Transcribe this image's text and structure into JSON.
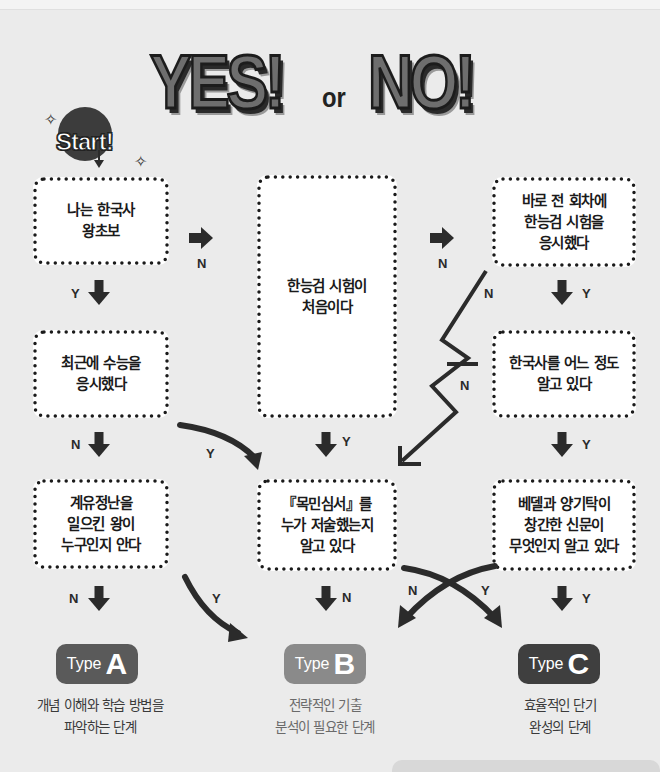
{
  "header": {
    "title_yes": "YES!",
    "title_or": "or",
    "title_no": "NO!",
    "start_label": "Start!"
  },
  "colors": {
    "background": "#ebebeb",
    "box_fill": "#ffffff",
    "arrow": "#2b2b2b",
    "type_a": "#5a5a5a",
    "type_b": "#8a8a8a",
    "type_c": "#3f3f3f"
  },
  "questions": {
    "q1": "나는 한국사\n왕초보",
    "q2": "최근에 수능을\n응시했다",
    "q3": "계유정난을\n일으킨 왕이\n누구인지 안다",
    "q4": "한능검 시험이\n처음이다",
    "q5": "『목민심서』를\n누가 저술했는지\n알고 있다",
    "q6": "바로 전 회차에\n한능검 시험을\n응시했다",
    "q7": "한국사를 어느 정도\n알고 있다",
    "q8": "베델과 양기탁이\n창간한 신문이\n무엇인지 알고 있다"
  },
  "arrow_labels": {
    "q1_yes": "Y",
    "q1_no": "N",
    "q2_yes": "Y",
    "q2_no": "N",
    "q3_yes": "Y",
    "q3_no": "N",
    "q4_yes": "Y",
    "q4_no": "N",
    "q5_no": "N",
    "q6_yes": "Y",
    "q6_no": "N",
    "q7_yes": "Y",
    "q7_no": "N",
    "q8_yes": "Y",
    "q8_no": "N",
    "q8_cross_yes": "Y"
  },
  "results": [
    {
      "word": "Type",
      "letter": "A",
      "description": "개념 이해와 학습 방법을\n파악하는 단계"
    },
    {
      "word": "Type",
      "letter": "B",
      "description": "전략적인 기출\n분석이 필요한 단계"
    },
    {
      "word": "Type",
      "letter": "C",
      "description": "효율적인 단기\n완성의 단계"
    }
  ]
}
